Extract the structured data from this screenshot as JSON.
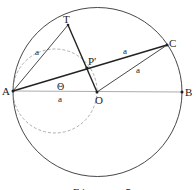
{
  "figure": {
    "caption": "Figure 5",
    "points": {
      "A": {
        "label": "A",
        "x": 13,
        "y": 91
      },
      "B": {
        "label": "B",
        "x": 182,
        "y": 92
      },
      "O": {
        "label": "O",
        "x": 97,
        "y": 92
      },
      "T": {
        "label": "T",
        "x": 68,
        "y": 25
      },
      "C": {
        "label": "C",
        "x": 167,
        "y": 45
      },
      "P": {
        "label": "P′",
        "x": 87,
        "y": 68
      }
    },
    "labels": {
      "AT": "a",
      "PC": "a",
      "OC": "a",
      "AO": "a",
      "angle": "Θ"
    },
    "colors": {
      "line": "#222222",
      "dashed": "#999999",
      "thin": "#888888"
    }
  }
}
